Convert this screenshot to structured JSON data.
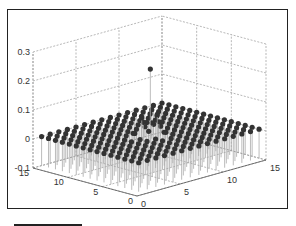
{
  "chart_data": {
    "type": "stem3",
    "title": "",
    "xlabel": "",
    "ylabel": "",
    "zlabel": "",
    "x_range": [
      0,
      15
    ],
    "y_range": [
      0,
      15
    ],
    "z_range": [
      -0.1,
      0.3
    ],
    "x_ticks": [
      "0",
      "5",
      "10",
      "15"
    ],
    "y_ticks": [
      "0",
      "5",
      "10",
      "15"
    ],
    "z_ticks": [
      "-0.1",
      "0",
      "0.1",
      "0.2",
      "0.3"
    ],
    "grid": true,
    "grid_style": "dashed",
    "marker": "filled circle",
    "marker_color": "#333333",
    "stem_color": "#aaaaaa",
    "base_grid": {
      "x": [
        1,
        2,
        3,
        4,
        5,
        6,
        7,
        8,
        9,
        10,
        11,
        12,
        13,
        14,
        15
      ],
      "y": [
        1,
        2,
        3,
        4,
        5,
        6,
        7,
        8,
        9,
        10,
        11,
        12,
        13,
        14,
        15
      ],
      "z_default": 0
    },
    "peaks": [
      {
        "x": 8,
        "y": 8,
        "z": 0.22
      },
      {
        "x": 7,
        "y": 8,
        "z": 0.06
      },
      {
        "x": 8,
        "y": 7,
        "z": 0.07
      },
      {
        "x": 9,
        "y": 8,
        "z": 0.03
      },
      {
        "x": 8,
        "y": 9,
        "z": 0.03
      },
      {
        "x": 7,
        "y": 7,
        "z": 0.02
      },
      {
        "x": 9,
        "y": 9,
        "z": 0.02
      },
      {
        "x": 6,
        "y": 8,
        "z": 0.015
      },
      {
        "x": 8,
        "y": 6,
        "z": 0.015
      }
    ]
  },
  "axis_labels": {
    "z": [
      "0.3",
      "0.2",
      "0.1",
      "0",
      "-0.1"
    ],
    "y": [
      "15",
      "10",
      "5",
      "0"
    ],
    "x": [
      "0",
      "5",
      "10",
      "15"
    ]
  }
}
